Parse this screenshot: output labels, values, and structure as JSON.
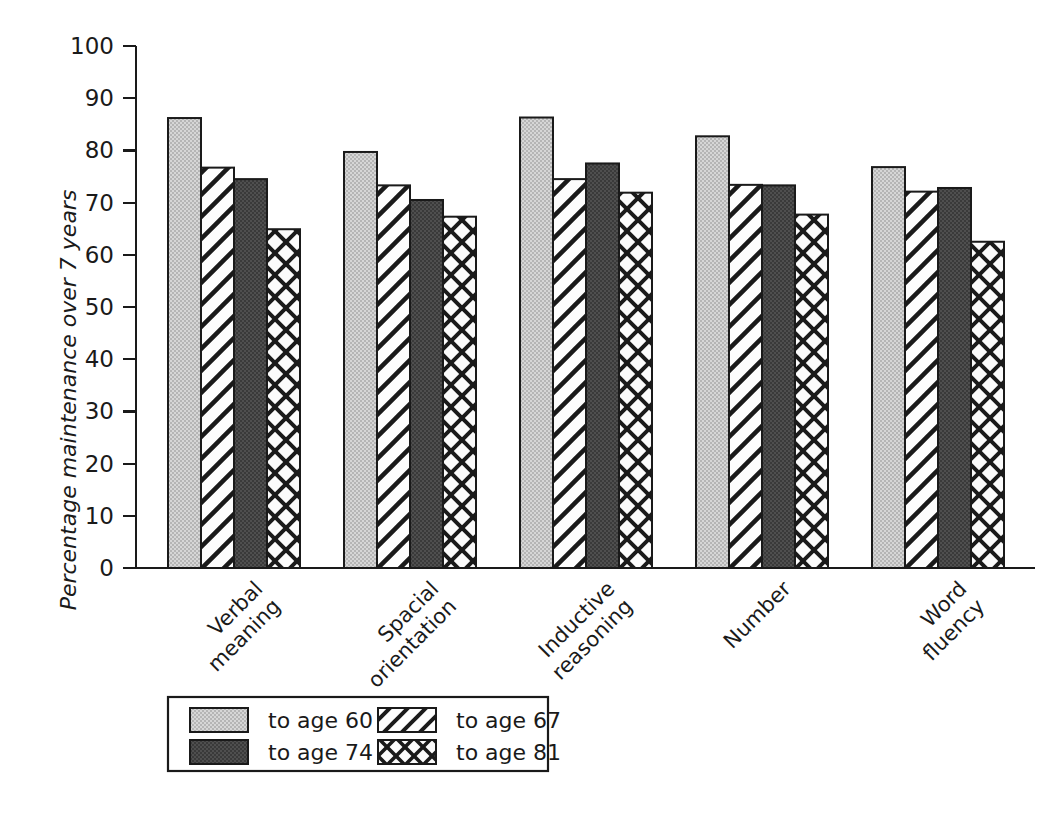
{
  "chart_data": {
    "type": "bar",
    "title": "",
    "xlabel": "",
    "ylabel": "Percentage maintenance over 7 years",
    "ylim": [
      0,
      100
    ],
    "ytick_step": 10,
    "grid": false,
    "legend_position": "bottom",
    "categories": [
      "Verbal\nmeaning",
      "Spacial\norientation",
      "Inductive\nreasoning",
      "Number",
      "Word\nfluency"
    ],
    "category_lines": [
      [
        "Verbal",
        "meaning"
      ],
      [
        "Spacial",
        "orientation"
      ],
      [
        "Inductive",
        "reasoning"
      ],
      [
        "Number",
        ""
      ],
      [
        "Word",
        "fluency"
      ]
    ],
    "yticks": [
      0,
      10,
      20,
      30,
      40,
      50,
      60,
      70,
      80,
      90,
      100
    ],
    "series": [
      {
        "name": "to age 60",
        "pattern": "light-gray-stipple",
        "color": "#c9c9c9",
        "values": [
          86.2,
          79.7,
          86.3,
          82.7,
          76.8
        ]
      },
      {
        "name": "to age 67",
        "pattern": "diagonal-hatch",
        "color": "#ffffff",
        "values": [
          76.7,
          73.3,
          74.5,
          73.4,
          72.1
        ]
      },
      {
        "name": "to age 74",
        "pattern": "dark-solid",
        "color": "#4a4a4a",
        "values": [
          74.5,
          70.5,
          77.5,
          73.3,
          72.8
        ]
      },
      {
        "name": "to age 81",
        "pattern": "cross-hatch",
        "color": "#ffffff",
        "values": [
          64.9,
          67.3,
          71.9,
          67.7,
          62.5
        ]
      }
    ]
  },
  "legend": {
    "entries": [
      {
        "label": "to age 60",
        "swatch": "light-gray-stipple-swatch"
      },
      {
        "label": "to age 67",
        "swatch": "diagonal-hatch-swatch"
      },
      {
        "label": "to age 74",
        "swatch": "dark-solid-swatch"
      },
      {
        "label": "to age 81",
        "swatch": "cross-hatch-swatch"
      }
    ]
  },
  "axis": {
    "y_title": "Percentage maintenance over 7 years",
    "y_tick_labels": [
      "0",
      "10",
      "20",
      "30",
      "40",
      "50",
      "60",
      "70",
      "80",
      "90",
      "100"
    ]
  },
  "colors": {
    "ink": "#1a1a1a",
    "light_fill": "#c9c9c9",
    "dark_fill": "#4a4a4a",
    "white_fill": "#ffffff",
    "background": "#ffffff"
  }
}
